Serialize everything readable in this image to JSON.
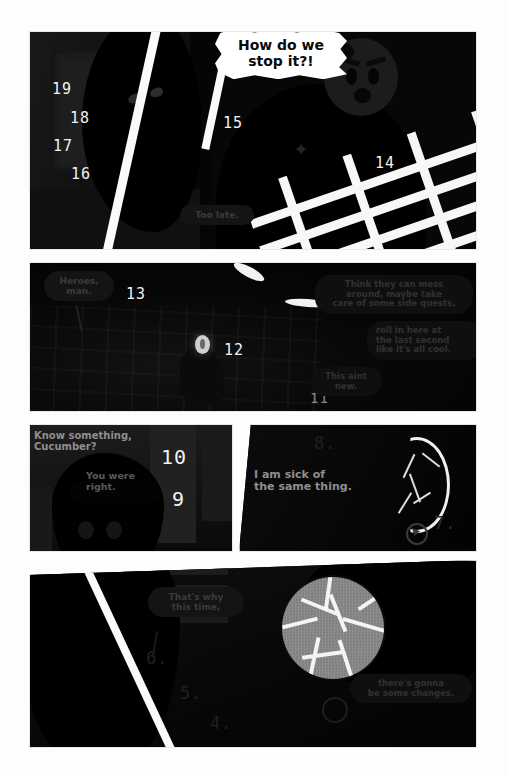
{
  "page": {
    "type": "comic-page",
    "background_color": "#fdfdfd",
    "gutter_color": "#fafafa",
    "ink_color": "#050505"
  },
  "panels": [
    {
      "id": "panel-1",
      "name": "panel-1-hallway",
      "countdown": [
        "19",
        "18",
        "17",
        "16",
        "15",
        "14"
      ],
      "balloons": [
        {
          "id": "shout",
          "text": "How do we\nstop it?!",
          "style": "shout"
        },
        {
          "id": "too-late",
          "text": "Too late.",
          "style": "dim"
        }
      ]
    },
    {
      "id": "panel-2",
      "name": "panel-2-ruins",
      "countdown": [
        "13",
        "12",
        "11"
      ],
      "balloons": [
        {
          "id": "heroes",
          "text": "Heroes,\nman.",
          "style": "dim"
        },
        {
          "id": "think-they",
          "text": "Think they can mess\naround, maybe take\ncare of some side quests,",
          "style": "dim2"
        },
        {
          "id": "roll-in",
          "text": "roll in here at\nthe last second\nlike it's all cool.",
          "style": "dim2"
        },
        {
          "id": "this-aint-new",
          "text": "This aint\nnew.",
          "style": "dim2"
        }
      ]
    },
    {
      "id": "panel-3",
      "name": "panel-3-interior",
      "countdown": [
        "10",
        "9"
      ],
      "balloons": [
        {
          "id": "know-something",
          "text": "Know something,\nCucumber?",
          "style": "outline"
        },
        {
          "id": "you-were-right",
          "text": "You were\nright.",
          "style": "outline-dim"
        }
      ]
    },
    {
      "id": "panel-4",
      "name": "panel-4-moon",
      "countdown": [
        "8.",
        "7."
      ],
      "balloons": [
        {
          "id": "sick-of",
          "text_before": "I ",
          "text_bold": "am",
          "text_after": " sick of\nthe same thing.",
          "style": "outline"
        }
      ]
    },
    {
      "id": "panel-5",
      "name": "panel-5-sphere",
      "countdown": [
        "6.",
        "5.",
        "4."
      ],
      "balloons": [
        {
          "id": "thats-why",
          "text": "That's why\nthis time,",
          "style": "dim"
        },
        {
          "id": "changes",
          "text": "there's gonna\nbe some changes.",
          "style": "dim2"
        }
      ]
    }
  ],
  "countdown_all": [
    "19",
    "18",
    "17",
    "16",
    "15",
    "14",
    "13",
    "12",
    "11",
    "10",
    "9",
    "8.",
    "7.",
    "6.",
    "5.",
    "4."
  ]
}
